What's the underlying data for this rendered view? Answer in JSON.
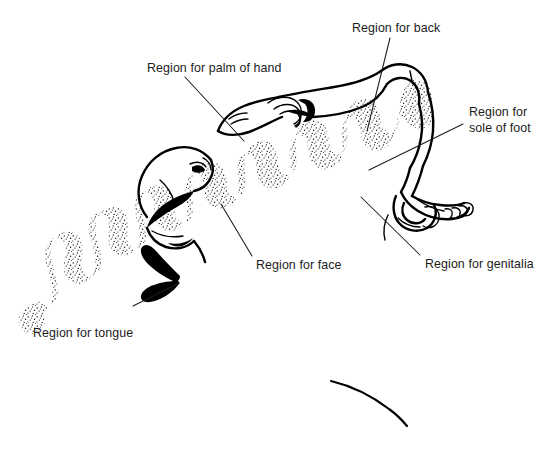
{
  "figure": {
    "kind": "anatomical-diagram",
    "background_color": "#ffffff",
    "ink_color": "#000000",
    "text_color": "#1c1c1c",
    "width": 554,
    "height": 474
  },
  "annotations": [
    {
      "id": "palm-of-hand",
      "label": "Region for palm of hand",
      "text_x": 147,
      "text_y": 72,
      "anchor": "start",
      "leader": "M185,77 L244,141"
    },
    {
      "id": "back",
      "label": "Region for back",
      "text_x": 352,
      "text_y": 32,
      "anchor": "start",
      "leader": "M390,38 L367,131"
    },
    {
      "id": "sole-of-foot",
      "label": "Region for",
      "label2": "sole of foot",
      "text_x": 469,
      "text_y": 116,
      "text_y2": 132,
      "anchor": "start",
      "leader": "M463,124 L369,170"
    },
    {
      "id": "genitalia",
      "label": "Region for genitalia",
      "text_x": 425,
      "text_y": 268,
      "anchor": "start",
      "leader": "M420,255 L361,197"
    },
    {
      "id": "face",
      "label": "Region for face",
      "text_x": 256,
      "text_y": 269,
      "anchor": "start",
      "leader": "M252,256 L221,204"
    },
    {
      "id": "tongue",
      "label": "Region for tongue",
      "text_x": 33,
      "text_y": 337,
      "anchor": "start",
      "leader": "M133,306 L179,283"
    }
  ],
  "parts": [
    {
      "id": "cortical-band",
      "name": "stippled cortical strip"
    },
    {
      "id": "hand-figure",
      "name": "hand with fingers"
    },
    {
      "id": "head-figure",
      "name": "head with face and open mouth"
    },
    {
      "id": "tongue-figure",
      "name": "tongue"
    },
    {
      "id": "foot-figure",
      "name": "foot with toes"
    },
    {
      "id": "leg-figure",
      "name": "leg and hip"
    },
    {
      "id": "arm-figure",
      "name": "arm and shoulder"
    }
  ]
}
